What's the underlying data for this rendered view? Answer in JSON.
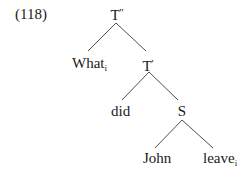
{
  "example_number": "(118)",
  "tree": {
    "root": {
      "label": "T",
      "prime": "''",
      "children": [
        "what",
        "t_bar"
      ]
    },
    "nodes": {
      "t_double_bar": {
        "base": "T",
        "prime": "''"
      },
      "what": {
        "base": "What",
        "subscript": "i"
      },
      "t_bar": {
        "base": "T",
        "prime": "'"
      },
      "did": {
        "base": "did"
      },
      "s": {
        "base": "S"
      },
      "john": {
        "base": "John"
      },
      "leave": {
        "base": "leave",
        "subscript": "i"
      }
    },
    "edges": [
      {
        "from": "T''",
        "to": "What_i"
      },
      {
        "from": "T''",
        "to": "T'"
      },
      {
        "from": "T'",
        "to": "did"
      },
      {
        "from": "T'",
        "to": "S"
      },
      {
        "from": "S",
        "to": "John"
      },
      {
        "from": "S",
        "to": "leave_i"
      }
    ]
  },
  "colors": {
    "line": "#3a3a3a",
    "text": "#1a1a1a",
    "background": "#ffffff"
  }
}
